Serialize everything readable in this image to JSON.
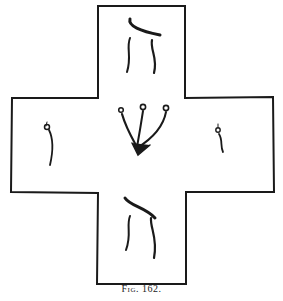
{
  "figure": {
    "caption": "Fig. 162.",
    "letters": {
      "top": "ה",
      "left": "י",
      "center": "ש",
      "right": "ו",
      "bottom": "ה"
    },
    "ink_color": "#1a1a1a",
    "paper_color": "#ffffff"
  }
}
